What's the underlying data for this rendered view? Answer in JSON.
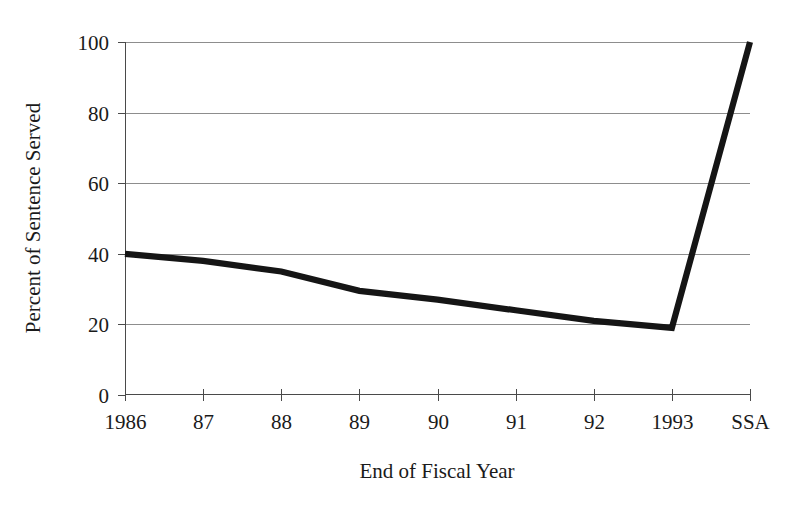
{
  "chart_data": {
    "type": "line",
    "title": "",
    "subtitle": "",
    "xlabel": "End of Fiscal Year",
    "ylabel": "Percent of Sentence Served",
    "categories": [
      "1986",
      "87",
      "88",
      "89",
      "90",
      "91",
      "92",
      "1993",
      "SSA"
    ],
    "values": [
      40,
      38,
      35,
      29.5,
      27,
      24,
      21,
      19,
      100
    ],
    "series": [
      {
        "name": "Percent of Sentence Served",
        "values": [
          40,
          38,
          35,
          29.5,
          27,
          24,
          21,
          19,
          100
        ]
      }
    ],
    "ylim": [
      0,
      100
    ],
    "ytick_labels": [
      "0",
      "20",
      "40",
      "60",
      "80",
      "100"
    ],
    "ytick_values": [
      0,
      20,
      40,
      60,
      80,
      100
    ],
    "xtick_labels": [
      "1986",
      "87",
      "88",
      "89",
      "90",
      "91",
      "92",
      "1993",
      "SSA"
    ],
    "grid": true,
    "grid_axis": "y",
    "legend": false,
    "legend_position": "none",
    "annotations": [],
    "line_color": "#151515",
    "grid_color": "#8d8d8d",
    "axis_color": "#4a4a4a",
    "background_color": "#ffffff"
  },
  "axes": {
    "y_title": "Percent of Sentence Served",
    "x_title": "End of Fiscal Year",
    "y_ticks": [
      {
        "label": "100",
        "value": 100
      },
      {
        "label": "80",
        "value": 80
      },
      {
        "label": "60",
        "value": 60
      },
      {
        "label": "40",
        "value": 40
      },
      {
        "label": "20",
        "value": 20
      },
      {
        "label": "0",
        "value": 0
      }
    ],
    "x_ticks": [
      {
        "label": "1986",
        "value": 0
      },
      {
        "label": "87",
        "value": 1
      },
      {
        "label": "88",
        "value": 2
      },
      {
        "label": "89",
        "value": 3
      },
      {
        "label": "90",
        "value": 4
      },
      {
        "label": "91",
        "value": 5
      },
      {
        "label": "92",
        "value": 6
      },
      {
        "label": "1993",
        "value": 7
      },
      {
        "label": "SSA",
        "value": 8
      }
    ]
  }
}
